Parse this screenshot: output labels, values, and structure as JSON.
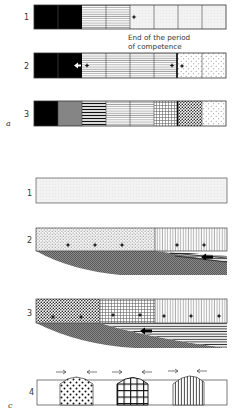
{
  "figure": {
    "panels": [
      {
        "label": "a",
        "rows": [
          {
            "label": "1",
            "cells": [
              "solid-black",
              "solid-black",
              "horizontal-lines",
              "horizontal-lines",
              "light-stipple",
              "light-stipple",
              "light-stipple",
              "light-stipple"
            ],
            "markers": [
              "dot at start of cell 5"
            ]
          },
          {
            "label": "2",
            "cells": [
              "solid-black",
              "solid-black",
              "horizontal-lines",
              "horizontal-lines",
              "horizontal-lines",
              "horizontal-lines",
              "sparse-dots",
              "sparse-dots"
            ],
            "markers": [
              "white arrow + dot at boundary 2/3",
              "dot + thick bar + dot at boundary 6/7"
            ]
          },
          {
            "label": "3",
            "cells": [
              "solid-black",
              "dense-horizontal-lines",
              "bold-horizontal-lines",
              "horizontal-lines",
              "horizontal-lines",
              "grid",
              "dense-dots",
              "sparse-dots"
            ],
            "markers": [
              "thick bar at boundary 6/7"
            ]
          }
        ],
        "annotation": "End of the period of competence"
      },
      {
        "label": "c",
        "rows": [
          {
            "label": "1",
            "description": "uniform light stipple bar"
          },
          {
            "label": "2",
            "description": "dotted region (3 dots) + vertical-lines region (2 dots) over shaded wedge with arrow"
          },
          {
            "label": "3",
            "description": "dotted (2 dots), grid (2 dots), vertical-lines (3 dots) regions over shaded wedge with arrow"
          },
          {
            "label": "4",
            "description": "three domed regions (dots, grid, vertical lines) with converging arrows"
          }
        ]
      }
    ]
  },
  "labels": {
    "a_row1": "1",
    "a_row2": "2",
    "a_row3": "3",
    "panel_a": "a",
    "annot_line1": "End of the period",
    "annot_line2": "of competence",
    "c_row1": "1",
    "c_row2": "2",
    "c_row3": "3",
    "c_row4": "4",
    "panel_c": "c"
  }
}
